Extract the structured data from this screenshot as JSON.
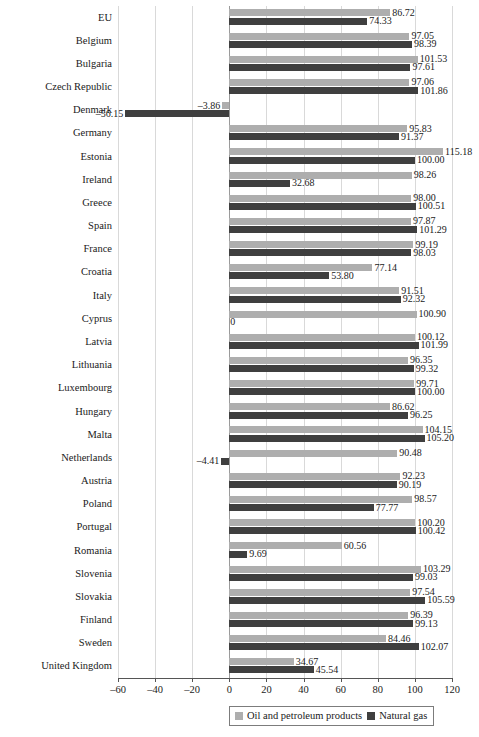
{
  "chart_data": {
    "type": "bar",
    "orientation": "horizontal",
    "title": "",
    "subtitle": "",
    "xlabel": "",
    "ylabel": "",
    "xlim": [
      -60,
      120
    ],
    "xticks": [
      -60,
      -40,
      -20,
      0,
      20,
      40,
      60,
      80,
      100,
      120
    ],
    "xtick_labels": [
      "–60",
      "–40",
      "–20",
      "0",
      "20",
      "40",
      "60",
      "80",
      "100",
      "120"
    ],
    "grid": true,
    "grid_axis": "x",
    "legend_position": "bottom",
    "categories": [
      "EU",
      "Belgium",
      "Bulgaria",
      "Czech Republic",
      "Denmark",
      "Germany",
      "Estonia",
      "Ireland",
      "Greece",
      "Spain",
      "France",
      "Croatia",
      "Italy",
      "Cyprus",
      "Latvia",
      "Lithuania",
      "Luxembourg",
      "Hungary",
      "Malta",
      "Netherlands",
      "Austria",
      "Poland",
      "Portugal",
      "Romania",
      "Slovenia",
      "Slovakia",
      "Finland",
      "Sweden",
      "United Kingdom"
    ],
    "series": [
      {
        "name": "Oil and petroleum products",
        "color": "#aeaeae",
        "values": [
          86.72,
          97.05,
          101.53,
          97.06,
          -3.86,
          95.83,
          115.18,
          98.26,
          98.0,
          97.87,
          99.19,
          77.14,
          91.51,
          100.9,
          100.12,
          96.35,
          99.71,
          86.62,
          104.15,
          90.48,
          92.23,
          98.57,
          100.2,
          60.56,
          103.29,
          97.54,
          96.39,
          84.46,
          34.67
        ],
        "labels": [
          "86.72",
          "97.05",
          "101.53",
          "97.06",
          "–3.86",
          "95.83",
          "115.18",
          "98.26",
          "98.00",
          "97.87",
          "99.19",
          "77.14",
          "91.51",
          "100.90",
          "100.12",
          "96.35",
          "99.71",
          "86.62",
          "104.15",
          "90.48",
          "92.23",
          "98.57",
          "100.20",
          "60.56",
          "103.29",
          "97.54",
          "96.39",
          "84.46",
          "34.67"
        ]
      },
      {
        "name": "Natural gas",
        "color": "#3f3f3f",
        "values": [
          74.33,
          98.39,
          97.61,
          101.86,
          -56.15,
          91.37,
          100.0,
          32.68,
          100.51,
          101.29,
          98.03,
          53.8,
          92.32,
          0,
          101.99,
          99.32,
          100.0,
          96.25,
          105.2,
          -4.41,
          90.19,
          77.77,
          100.42,
          9.69,
          99.03,
          105.59,
          99.13,
          102.07,
          45.54
        ],
        "labels": [
          "74.33",
          "98.39",
          "97.61",
          "101.86",
          "–56.15",
          "91.37",
          "100.00",
          "32.68",
          "100.51",
          "101.29",
          "98.03",
          "53.80",
          "92.32",
          "0",
          "101.99",
          "99.32",
          "100.00",
          "96.25",
          "105.20",
          "–4.41",
          "90.19",
          "77.77",
          "100.42",
          "9.69",
          "99.03",
          "105.59",
          "99.13",
          "102.07",
          "45.54"
        ]
      }
    ]
  },
  "legend": {
    "entries": [
      {
        "label": "Oil and petroleum products",
        "color": "#aeaeae"
      },
      {
        "label": "Natural gas",
        "color": "#3f3f3f"
      }
    ]
  },
  "colors": {
    "oil": "#aeaeae",
    "gas": "#3f3f3f",
    "grid": "#d9d9d9",
    "axis": "#555555",
    "background": "#ffffff"
  }
}
